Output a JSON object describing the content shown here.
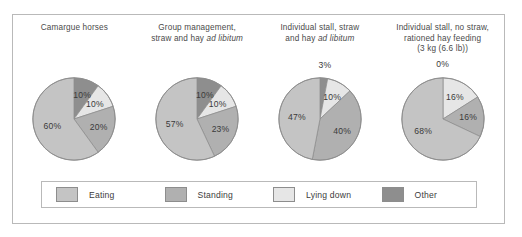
{
  "figure": {
    "frame_border_color": "#b9b9b9",
    "background": "#ffffff"
  },
  "legend": {
    "items": [
      {
        "label": "Eating",
        "color": "#c4c4c4"
      },
      {
        "label": "Standing",
        "color": "#b0b0b0"
      },
      {
        "label": "Lying down",
        "color": "#e6e6e6"
      },
      {
        "label": "Other",
        "color": "#8e8e8e"
      }
    ]
  },
  "panels": [
    {
      "title_line1": "Camargue horses",
      "title_line2": "",
      "title_line2_italic": "",
      "title_line3": ""
    },
    {
      "title_line1": "Group management,",
      "title_line2": "straw and hay ",
      "title_line2_italic": "ad libitum",
      "title_line3": ""
    },
    {
      "title_line1": "Individual stall, straw",
      "title_line2": "and hay ",
      "title_line2_italic": "ad libitum",
      "title_line3": ""
    },
    {
      "title_line1": "Individual stall, no straw,",
      "title_line2": "rationed hay feeding",
      "title_line2_italic": "",
      "title_line3": "(3 kg (6.6 lb))"
    }
  ],
  "chart_data": {
    "type": "pie",
    "categories": [
      "Eating",
      "Standing",
      "Lying down",
      "Other"
    ],
    "colors": [
      "#c4c4c4",
      "#b0b0b0",
      "#e6e6e6",
      "#8e8e8e"
    ],
    "unit": "%",
    "legend_position": "bottom",
    "charts": [
      {
        "title": "Camargue horses",
        "values": [
          60,
          20,
          10,
          10
        ],
        "labels": [
          "60%",
          "20%",
          "10%",
          "10%"
        ],
        "label_placement": [
          "inside",
          "inside",
          "inside",
          "inside"
        ]
      },
      {
        "title": "Group management, straw and hay ad libitum",
        "values": [
          57,
          23,
          10,
          10
        ],
        "labels": [
          "57%",
          "23%",
          "10%",
          "10%"
        ],
        "label_placement": [
          "inside",
          "inside",
          "inside",
          "inside"
        ]
      },
      {
        "title": "Individual stall, straw and hay ad libitum",
        "values": [
          47,
          40,
          10,
          3
        ],
        "labels": [
          "47%",
          "40%",
          "10%",
          "3%"
        ],
        "label_placement": [
          "inside",
          "inside",
          "inside",
          "outside"
        ]
      },
      {
        "title": "Individual stall, no straw, rationed hay feeding (3 kg (6.6 lb))",
        "values": [
          68,
          16,
          16,
          0
        ],
        "labels": [
          "68%",
          "16%",
          "16%",
          "0%"
        ],
        "label_placement": [
          "inside",
          "inside",
          "inside",
          "outside"
        ]
      }
    ]
  }
}
